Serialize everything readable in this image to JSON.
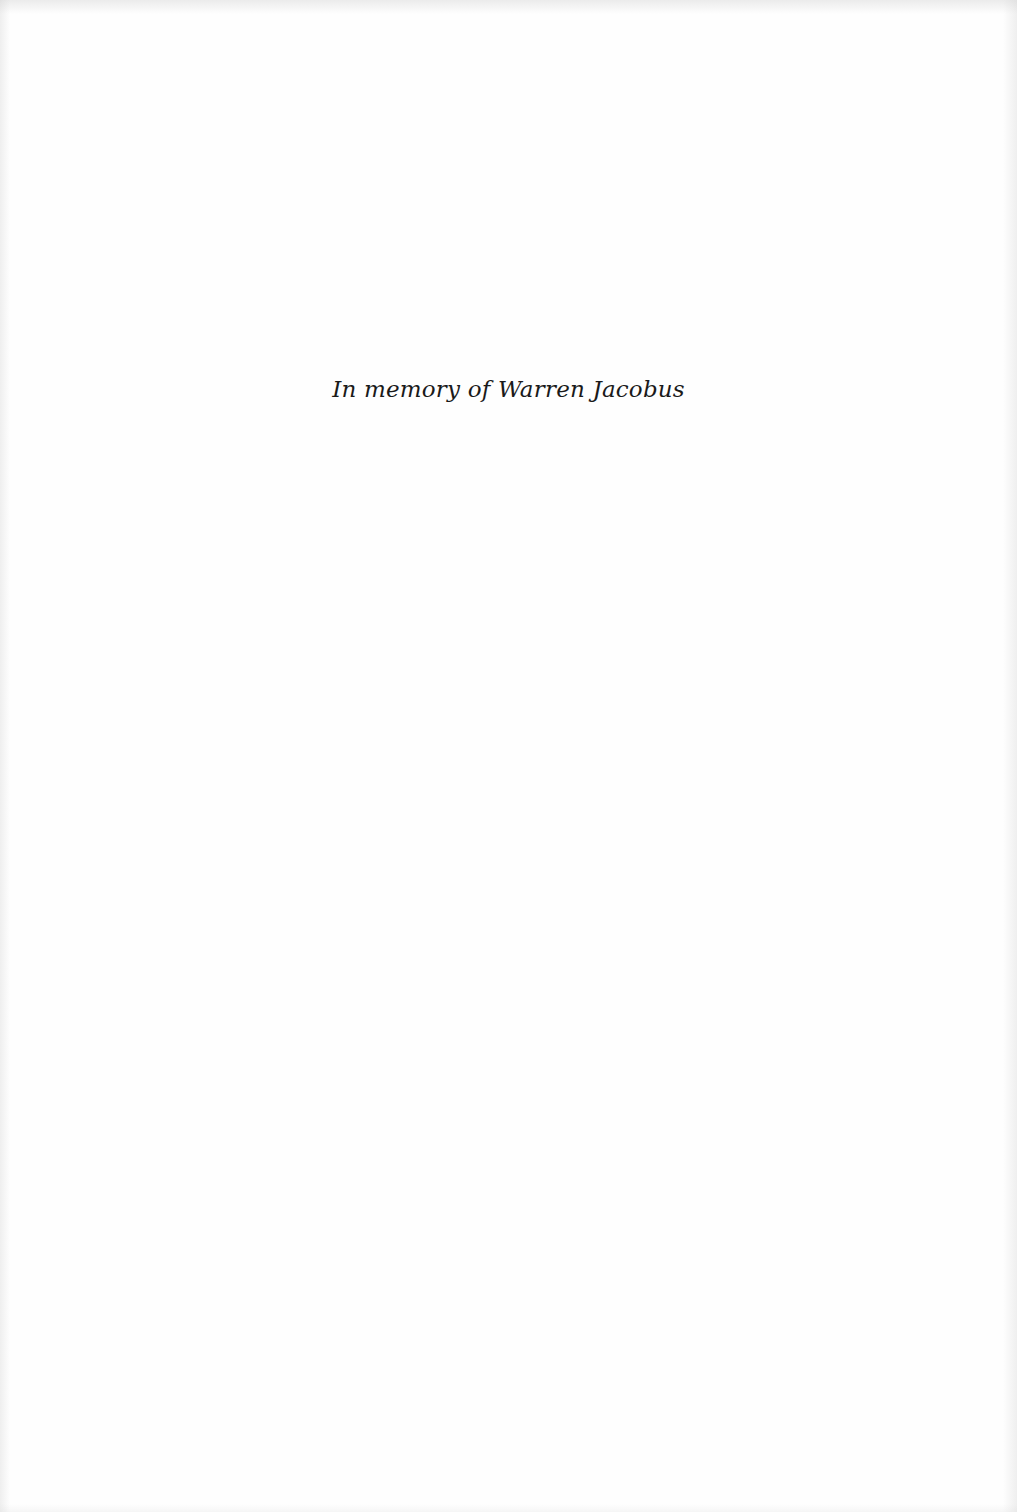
{
  "page": {
    "dedication": "In memory of Warren Jacobus"
  }
}
